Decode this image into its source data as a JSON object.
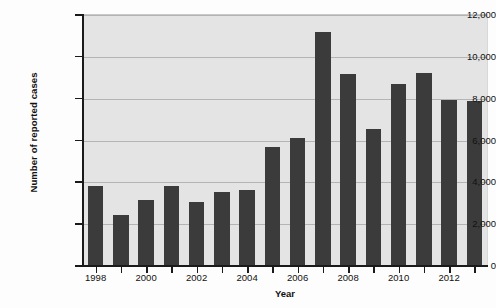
{
  "chart_data": {
    "type": "bar",
    "title": "",
    "xlabel": "Year",
    "ylabel": "Number of reported cases",
    "categories": [
      "1998",
      "1999",
      "2000",
      "2001",
      "2002",
      "2003",
      "2004",
      "2005",
      "2006",
      "2007",
      "2008",
      "2009",
      "2010",
      "2011",
      "2012",
      "2013"
    ],
    "values": [
      3830,
      2440,
      3160,
      3830,
      3040,
      3530,
      3630,
      5700,
      6130,
      11200,
      9180,
      6570,
      8690,
      9230,
      7950,
      7880
    ],
    "ylim": [
      0,
      12000
    ],
    "ytick_values": [
      0,
      2000,
      4000,
      6000,
      8000,
      10000,
      12000
    ],
    "ytick_labels": [
      "0",
      "2,000",
      "4,000",
      "6,000",
      "8,000",
      "10,000",
      "12,000"
    ],
    "xtick_labels": [
      "1998",
      "2000",
      "2002",
      "2004",
      "2006",
      "2008",
      "2010",
      "2012"
    ],
    "xtick_categories": [
      "1998",
      "2000",
      "2002",
      "2004",
      "2006",
      "2008",
      "2010",
      "2012"
    ],
    "grid": "horizontal",
    "legend": "none",
    "bar_color": "#3b3b3b",
    "plot_background": "#e4e4e4",
    "gridline_color": "#b4b4b4",
    "axis_color": "#1a1a1a"
  }
}
